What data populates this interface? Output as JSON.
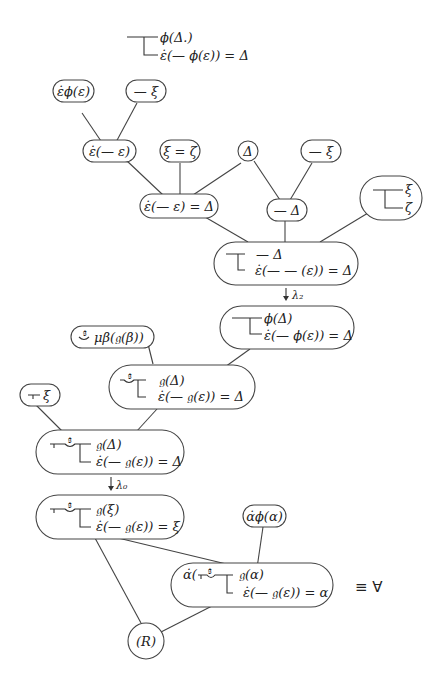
{
  "header_formula": {
    "line1": "ϕ(Δ.)",
    "line2": "ε̇(— ϕ(ε)) = Δ"
  },
  "nodes": {
    "eps_phi": "ε̇ϕ(ε)",
    "neg_xi_top": "— ξ",
    "eps_neg_eps": "ε̇(— ε)",
    "xi_eq_zeta": "ξ = ζ",
    "delta": "Δ",
    "neg_xi_right": "— ξ",
    "eps_neg_eps_eq_delta": "ε̇(— ε) = Δ",
    "neg_delta": "— Δ",
    "cond_xi": "ξ",
    "cond_zeta": "ζ",
    "merged_line1": "— Δ",
    "merged_line2": "ε̇(— — (ε)) = Δ",
    "phi_line1": "ϕ(Δ)",
    "phi_line2": "ε̇(— ϕ(ε)) = Δ",
    "mu_beta": "μβ(𝔤(β))",
    "g_delta_1_line1": "𝔤(Δ)",
    "g_delta_1_line2": "ε̇(— 𝔤(ε)) = Δ",
    "assert_xi": "ξ",
    "g_delta_2_line1": "𝔤(Δ)",
    "g_delta_2_line2": "ε̇(— 𝔤(ε)) = Δ",
    "g_xi_line1": "𝔤(ξ)",
    "g_xi_line2": "ε̇(— 𝔤(ε)) = ξ",
    "alpha_phi": "α̇ϕ(α)",
    "alpha_line1": "𝔤(α)",
    "alpha_line2": "ε̇(— 𝔤(ε)) = α",
    "alpha_prefix": "α̇(",
    "rule_R": "(R)",
    "gothic_var": "𝔤"
  },
  "arrows": {
    "lambda2": "λ₂",
    "lambda0": "λ₀"
  },
  "equiv_label": "≡ ∀"
}
